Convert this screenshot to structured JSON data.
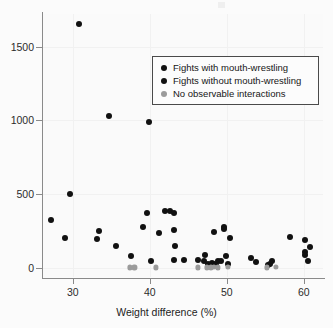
{
  "chart_data": {
    "type": "scatter",
    "title": "",
    "xlabel": "Weight difference (%)",
    "ylabel": "",
    "xlim": [
      26.0,
      62.5
    ],
    "ylim": [
      -60,
      1720
    ],
    "xticks": [
      30,
      40,
      50,
      60
    ],
    "yticks": [
      0,
      500,
      1000,
      1500
    ],
    "xticklabels": [
      "30",
      "40",
      "50",
      "60"
    ],
    "yticklabels": [
      "0",
      "500",
      "1000",
      "1500"
    ],
    "grid": true,
    "legend_position": "upper-center-right",
    "series": [
      {
        "name": "Fights with mouth-wrestling",
        "color": "#111111",
        "marker": "circle",
        "points": [
          [
            30.8,
            1650
          ],
          [
            34.7,
            1030
          ],
          [
            39.9,
            990
          ],
          [
            29.7,
            500
          ],
          [
            27.2,
            325
          ],
          [
            39.6,
            375
          ],
          [
            42.0,
            385
          ],
          [
            42.6,
            385
          ],
          [
            43.2,
            370
          ],
          [
            29.0,
            205
          ],
          [
            33.4,
            250
          ],
          [
            33.2,
            200
          ],
          [
            39.1,
            280
          ],
          [
            41.2,
            240
          ],
          [
            43.2,
            255
          ],
          [
            35.6,
            150
          ],
          [
            43.3,
            148
          ],
          [
            48.3,
            245
          ],
          [
            49.6,
            280
          ],
          [
            49.7,
            262
          ],
          [
            50.4,
            205
          ],
          [
            58.2,
            208
          ],
          [
            60.2,
            190
          ],
          [
            60.8,
            140
          ],
          [
            60.1,
            110
          ],
          [
            60.1,
            88
          ],
          [
            60.5,
            45
          ],
          [
            37.5,
            80
          ],
          [
            40.1,
            50
          ],
          [
            43.2,
            52
          ],
          [
            44.5,
            52
          ],
          [
            46.2,
            55
          ],
          [
            47.2,
            90
          ],
          [
            47.0,
            48
          ],
          [
            47.5,
            30
          ],
          [
            48.1,
            38
          ],
          [
            48.3,
            28
          ],
          [
            48.9,
            48
          ],
          [
            48.6,
            20
          ],
          [
            49.2,
            45
          ],
          [
            49.9,
            80
          ],
          [
            50.1,
            28
          ],
          [
            53.2,
            70
          ],
          [
            53.8,
            42
          ],
          [
            55.3,
            18
          ],
          [
            55.6,
            30
          ],
          [
            55.9,
            50
          ]
        ]
      },
      {
        "name": "Fights without mouth-wrestling",
        "color": "#111111",
        "marker": "circle",
        "points": []
      },
      {
        "name": "No observable interactions",
        "color": "#9b9b9b",
        "marker": "circle",
        "points": [
          [
            37.4,
            5
          ],
          [
            38.0,
            5
          ],
          [
            40.8,
            5
          ],
          [
            46.2,
            5
          ],
          [
            47.4,
            5
          ],
          [
            47.9,
            5
          ],
          [
            48.3,
            8
          ],
          [
            48.8,
            5
          ],
          [
            50.2,
            8
          ],
          [
            55.2,
            5
          ],
          [
            56.4,
            8
          ]
        ]
      }
    ]
  },
  "axes": {
    "x_title": "Weight difference (%)",
    "x_ticklabels": [
      "30",
      "40",
      "50",
      "60"
    ],
    "y_ticklabels": [
      "0",
      "500",
      "1000",
      "1500"
    ]
  },
  "legend": {
    "entries": [
      {
        "label": "Fights with mouth-wrestling",
        "swatch": "dark"
      },
      {
        "label": "Fights without mouth-wrestling",
        "swatch": "dark"
      },
      {
        "label": "No observable interactions",
        "swatch": "gray"
      }
    ]
  }
}
